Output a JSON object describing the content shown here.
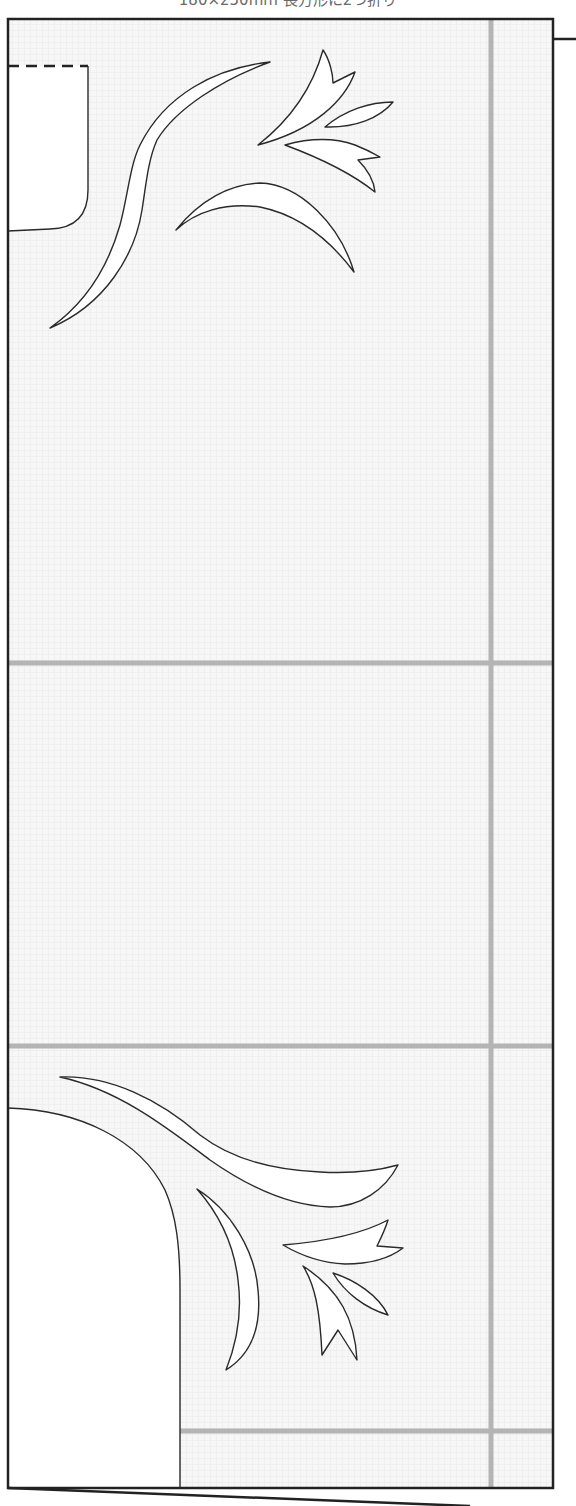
{
  "header": {
    "title": "180×250mm 長方形に2つ折り"
  },
  "pattern": {
    "paper_size": "180×250mm",
    "fold_instruction": "長方形に2つ折り",
    "colors": {
      "outline": "#2a2a2a",
      "border": "#222222",
      "guide_line": "#b4b4b4",
      "paper": "#f7f7f7",
      "cutout": "#ffffff"
    },
    "guides": {
      "vertical_x": 491,
      "horizontal_y": [
        663,
        1046,
        1431
      ]
    }
  }
}
